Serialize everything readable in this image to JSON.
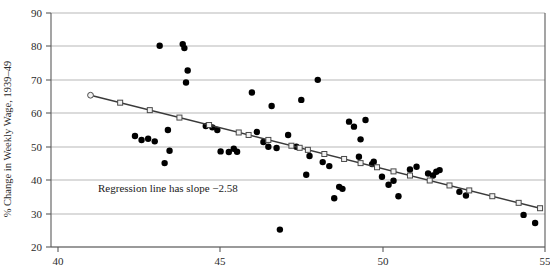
{
  "chart_data": {
    "type": "scatter",
    "title": "",
    "xlabel": "",
    "ylabel": "% Change in Weekly Wage, 1939–49",
    "xlim": [
      40,
      55
    ],
    "ylim": [
      20,
      90
    ],
    "xticks": [
      40,
      45,
      50,
      55
    ],
    "yticks": [
      20,
      30,
      40,
      50,
      60,
      70,
      80,
      90
    ],
    "xtick_labels": [
      "40",
      "45",
      "50",
      "55"
    ],
    "ytick_labels": [
      "20",
      "30",
      "40",
      "50",
      "60",
      "70",
      "80",
      "90"
    ],
    "grid": "horizontal",
    "legend": "none",
    "annotations": [
      {
        "text": "Regression line has slope −2.58",
        "x": 42.0,
        "y": 36.8
      }
    ],
    "series": [
      {
        "name": "observations",
        "marker": "filled-circle",
        "color": "#000000",
        "points": [
          [
            42.55,
            53.2
          ],
          [
            42.75,
            52.0
          ],
          [
            42.95,
            52.4
          ],
          [
            43.15,
            51.6
          ],
          [
            43.3,
            80.2
          ],
          [
            43.45,
            45.1
          ],
          [
            43.55,
            55.0
          ],
          [
            44.0,
            80.7
          ],
          [
            44.05,
            79.5
          ],
          [
            44.1,
            69.2
          ],
          [
            44.15,
            72.8
          ],
          [
            43.6,
            48.8
          ],
          [
            44.7,
            56.2
          ],
          [
            44.9,
            55.8
          ],
          [
            45.05,
            55.0
          ],
          [
            45.15,
            48.6
          ],
          [
            45.4,
            48.4
          ],
          [
            45.55,
            49.4
          ],
          [
            45.65,
            48.5
          ],
          [
            46.1,
            66.2
          ],
          [
            46.25,
            54.4
          ],
          [
            46.45,
            51.4
          ],
          [
            46.6,
            50.0
          ],
          [
            46.7,
            62.2
          ],
          [
            46.85,
            49.6
          ],
          [
            46.95,
            25.2
          ],
          [
            47.2,
            53.5
          ],
          [
            47.45,
            50.0
          ],
          [
            47.6,
            64.0
          ],
          [
            47.75,
            41.6
          ],
          [
            47.85,
            47.2
          ],
          [
            48.1,
            70.0
          ],
          [
            48.25,
            45.4
          ],
          [
            48.45,
            44.2
          ],
          [
            48.6,
            34.6
          ],
          [
            48.75,
            38.0
          ],
          [
            48.85,
            37.4
          ],
          [
            49.05,
            57.5
          ],
          [
            49.2,
            56.0
          ],
          [
            49.35,
            47.0
          ],
          [
            49.4,
            52.2
          ],
          [
            49.55,
            58.0
          ],
          [
            49.75,
            44.8
          ],
          [
            49.8,
            45.5
          ],
          [
            50.05,
            41.0
          ],
          [
            50.25,
            38.6
          ],
          [
            50.4,
            39.8
          ],
          [
            50.55,
            35.2
          ],
          [
            50.9,
            43.2
          ],
          [
            51.1,
            44.0
          ],
          [
            51.45,
            42.0
          ],
          [
            51.6,
            41.4
          ],
          [
            51.7,
            42.5
          ],
          [
            51.8,
            43.0
          ],
          [
            52.4,
            36.5
          ],
          [
            52.6,
            35.4
          ],
          [
            54.35,
            29.6
          ],
          [
            54.7,
            27.2
          ]
        ]
      }
    ],
    "fit_line": {
      "name": "regression-line",
      "slope": -2.58,
      "marker": "open-square",
      "x_start": 41.2,
      "y_start": 65.4,
      "x_end": 54.85,
      "y_end": 31.6,
      "marker_x": [
        41.2,
        42.1,
        43.0,
        43.9,
        44.8,
        45.7,
        46.0,
        46.6,
        47.3,
        47.55,
        47.8,
        48.3,
        48.9,
        49.4,
        49.9,
        50.4,
        50.9,
        51.5,
        52.1,
        52.7,
        53.4,
        54.2,
        54.85
      ]
    }
  },
  "figure": {
    "background_color": "#ffffff",
    "point_color": "#000000",
    "line_color": "#3a3a3a",
    "grid_color": "#9a9a9a",
    "axis_color": "#5a5a5a"
  }
}
